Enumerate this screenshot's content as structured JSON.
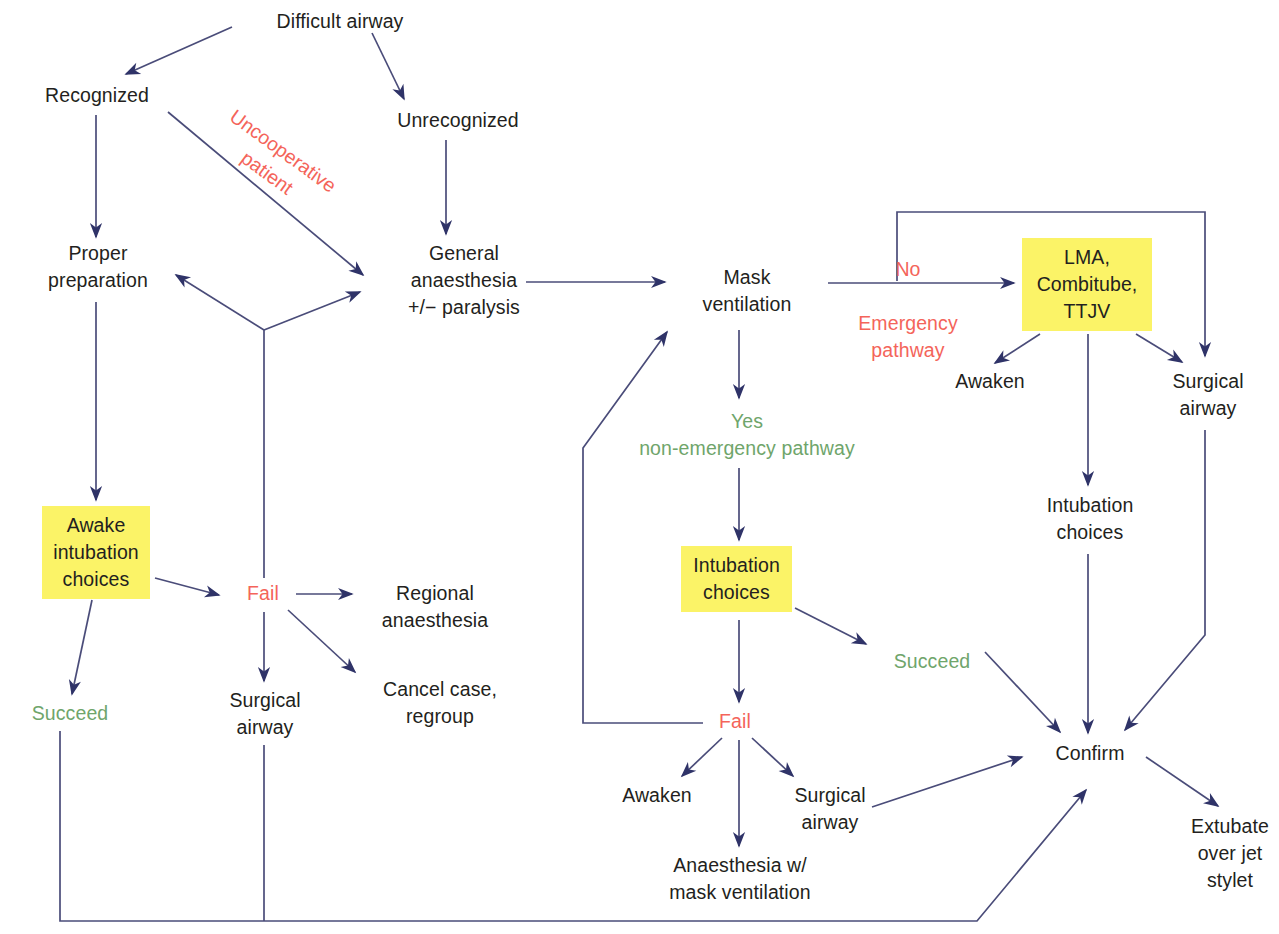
{
  "diagram": {
    "colors": {
      "line": "#3d3f6e",
      "arrow": "#2f3368",
      "text": "#231f20",
      "red": "#f4645a",
      "green": "#6fa56b",
      "highlight": "#fbf367",
      "background": "#ffffff"
    },
    "nodes": [
      {
        "id": "difficult_airway",
        "label": "Difficult airway",
        "style": "plain",
        "x": 240,
        "y": 8,
        "w": 200,
        "h": 28
      },
      {
        "id": "recognized",
        "label": "Recognized",
        "style": "plain",
        "x": 22,
        "y": 82,
        "w": 150,
        "h": 28
      },
      {
        "id": "unrecognized",
        "label": "Unrecognized",
        "style": "plain",
        "x": 378,
        "y": 107,
        "w": 160,
        "h": 28
      },
      {
        "id": "proper_preparation",
        "label": "Proper\npreparation",
        "style": "plain",
        "x": 28,
        "y": 240,
        "w": 140,
        "h": 56
      },
      {
        "id": "general_anaesthesia",
        "label": "General\nanaesthesia\n+/− paralysis",
        "style": "plain",
        "x": 388,
        "y": 240,
        "w": 152,
        "h": 84
      },
      {
        "id": "awake_intubation",
        "label": "Awake\nintubation\nchoices",
        "style": "box",
        "x": 42,
        "y": 506,
        "w": 108,
        "h": 92
      },
      {
        "id": "fail_left",
        "label": "Fail",
        "style": "red",
        "x": 228,
        "y": 580,
        "w": 70,
        "h": 28
      },
      {
        "id": "regional_anaesthesia",
        "label": "Regional\nanaesthesia",
        "style": "plain",
        "x": 360,
        "y": 580,
        "w": 150,
        "h": 56
      },
      {
        "id": "surgical_airway_left",
        "label": "Surgical\nairway",
        "style": "plain",
        "x": 205,
        "y": 687,
        "w": 120,
        "h": 56
      },
      {
        "id": "cancel_case",
        "label": "Cancel case,\nregroup",
        "style": "plain",
        "x": 360,
        "y": 676,
        "w": 160,
        "h": 56
      },
      {
        "id": "succeed_left",
        "label": "Succeed",
        "style": "green",
        "x": 10,
        "y": 700,
        "w": 120,
        "h": 28
      },
      {
        "id": "mask_ventilation",
        "label": "Mask\nventilation",
        "style": "plain",
        "x": 672,
        "y": 264,
        "w": 150,
        "h": 56
      },
      {
        "id": "no_emergency",
        "label": "No\n\nEmergency\npathway",
        "style": "red",
        "x": 828,
        "y": 256,
        "w": 160,
        "h": 100
      },
      {
        "id": "yes_non_emergency",
        "label": "Yes\nnon-emergency pathway",
        "style": "green",
        "x": 597,
        "y": 408,
        "w": 300,
        "h": 56
      },
      {
        "id": "lma_combitube_ttjv",
        "label": "LMA,\nCombitube,\nTTJV",
        "style": "box",
        "x": 1022,
        "y": 238,
        "w": 130,
        "h": 92
      },
      {
        "id": "awaken_right",
        "label": "Awaken",
        "style": "plain",
        "x": 930,
        "y": 368,
        "w": 120,
        "h": 28
      },
      {
        "id": "surgical_airway_right",
        "label": "Surgical\nairway",
        "style": "plain",
        "x": 1148,
        "y": 368,
        "w": 120,
        "h": 56
      },
      {
        "id": "intubation_choices_r",
        "label": "Intubation\nchoices",
        "style": "plain",
        "x": 1020,
        "y": 492,
        "w": 140,
        "h": 56
      },
      {
        "id": "intubation_choices_c",
        "label": "Intubation\nchoices",
        "style": "box",
        "x": 681,
        "y": 546,
        "w": 111,
        "h": 70
      },
      {
        "id": "succeed_center",
        "label": "Succeed",
        "style": "green",
        "x": 872,
        "y": 648,
        "w": 120,
        "h": 28
      },
      {
        "id": "fail_center",
        "label": "Fail",
        "style": "red",
        "x": 700,
        "y": 708,
        "w": 70,
        "h": 28
      },
      {
        "id": "awaken_center",
        "label": "Awaken",
        "style": "plain",
        "x": 597,
        "y": 782,
        "w": 120,
        "h": 28
      },
      {
        "id": "surgical_airway_c",
        "label": "Surgical\nairway",
        "style": "plain",
        "x": 775,
        "y": 782,
        "w": 110,
        "h": 56
      },
      {
        "id": "anaesthesia_mask",
        "label": "Anaesthesia w/\nmask ventilation",
        "style": "plain",
        "x": 640,
        "y": 852,
        "w": 200,
        "h": 56
      },
      {
        "id": "confirm",
        "label": "Confirm",
        "style": "plain",
        "x": 1030,
        "y": 740,
        "w": 120,
        "h": 28
      },
      {
        "id": "extubate_jet_stylet",
        "label": "Extubate\nover jet\nstylet",
        "style": "plain",
        "x": 1180,
        "y": 813,
        "w": 100,
        "h": 84
      }
    ],
    "rotated_labels": [
      {
        "id": "uncooperative_patient",
        "label": "Uncooperative\npatient",
        "x": 190,
        "y": 135,
        "w": 170,
        "h": 62,
        "rotate": 36
      }
    ],
    "edges": [
      {
        "from": "difficult_airway",
        "to": "recognized",
        "kind": "arrow"
      },
      {
        "from": "difficult_airway",
        "to": "unrecognized",
        "kind": "arrow"
      },
      {
        "from": "recognized",
        "to": "proper_preparation",
        "kind": "arrow"
      },
      {
        "from": "recognized",
        "to": "general_anaesthesia",
        "kind": "arrow",
        "label": "Uncooperative patient"
      },
      {
        "from": "unrecognized",
        "to": "general_anaesthesia",
        "kind": "arrow"
      },
      {
        "from": "proper_preparation",
        "to": "awake_intubation",
        "kind": "arrow"
      },
      {
        "from": "awake_intubation",
        "to": "fail_left",
        "kind": "arrow"
      },
      {
        "from": "awake_intubation",
        "to": "succeed_left",
        "kind": "arrow"
      },
      {
        "from": "fail_left",
        "to": "regional_anaesthesia",
        "kind": "arrow"
      },
      {
        "from": "fail_left",
        "to": "surgical_airway_left",
        "kind": "arrow"
      },
      {
        "from": "fail_left",
        "to": "cancel_case",
        "kind": "arrow"
      },
      {
        "from": "fail_left",
        "to": "proper_preparation",
        "kind": "arrow"
      },
      {
        "from": "fail_left",
        "to": "general_anaesthesia",
        "kind": "arrow"
      },
      {
        "from": "general_anaesthesia",
        "to": "mask_ventilation",
        "kind": "arrow"
      },
      {
        "from": "mask_ventilation",
        "to": "lma_combitube_ttjv",
        "kind": "arrow",
        "label": "No / Emergency pathway"
      },
      {
        "from": "mask_ventilation",
        "to": "yes_non_emergency",
        "kind": "arrow",
        "label": "Yes non-emergency pathway"
      },
      {
        "from": "mask_ventilation",
        "to": "surgical_airway_right",
        "kind": "arrow"
      },
      {
        "from": "lma_combitube_ttjv",
        "to": "awaken_right",
        "kind": "arrow"
      },
      {
        "from": "lma_combitube_ttjv",
        "to": "surgical_airway_right",
        "kind": "arrow"
      },
      {
        "from": "lma_combitube_ttjv",
        "to": "intubation_choices_r",
        "kind": "arrow"
      },
      {
        "from": "intubation_choices_r",
        "to": "confirm",
        "kind": "arrow"
      },
      {
        "from": "surgical_airway_right",
        "to": "confirm",
        "kind": "arrow"
      },
      {
        "from": "yes_non_emergency",
        "to": "intubation_choices_c",
        "kind": "arrow"
      },
      {
        "from": "intubation_choices_c",
        "to": "succeed_center",
        "kind": "arrow"
      },
      {
        "from": "intubation_choices_c",
        "to": "fail_center",
        "kind": "arrow"
      },
      {
        "from": "succeed_center",
        "to": "confirm",
        "kind": "arrow"
      },
      {
        "from": "fail_center",
        "to": "awaken_center",
        "kind": "arrow"
      },
      {
        "from": "fail_center",
        "to": "surgical_airway_c",
        "kind": "arrow"
      },
      {
        "from": "fail_center",
        "to": "anaesthesia_mask",
        "kind": "arrow"
      },
      {
        "from": "fail_center",
        "to": "mask_ventilation",
        "kind": "arrow"
      },
      {
        "from": "surgical_airway_c",
        "to": "confirm",
        "kind": "arrow"
      },
      {
        "from": "succeed_left",
        "to": "confirm",
        "kind": "arrow"
      },
      {
        "from": "surgical_airway_left",
        "to": "confirm",
        "kind": "arrow"
      },
      {
        "from": "confirm",
        "to": "extubate_jet_stylet",
        "kind": "arrow"
      }
    ]
  }
}
